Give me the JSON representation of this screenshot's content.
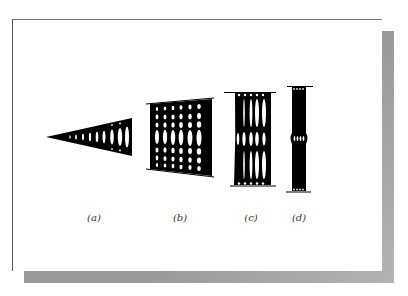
{
  "figure": {
    "panels": [
      {
        "id": "a",
        "label": "(a)",
        "x": 94
      },
      {
        "id": "b",
        "label": "(b)",
        "x": 180
      },
      {
        "id": "c",
        "label": "(c)",
        "x": 251
      },
      {
        "id": "d",
        "label": "(d)",
        "x": 299
      }
    ]
  },
  "colors": {
    "structure": "#000000",
    "background": "#ffffff",
    "shadow": "#9a9a9a"
  }
}
